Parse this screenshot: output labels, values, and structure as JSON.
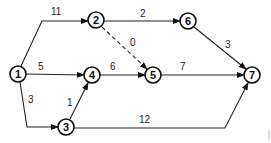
{
  "diagram": {
    "type": "activity-network",
    "nodes": [
      {
        "id": "1",
        "label": "1",
        "x": 18,
        "y": 74
      },
      {
        "id": "2",
        "label": "2",
        "x": 96,
        "y": 20
      },
      {
        "id": "3",
        "label": "3",
        "x": 66,
        "y": 127
      },
      {
        "id": "4",
        "label": "4",
        "x": 92,
        "y": 75
      },
      {
        "id": "5",
        "label": "5",
        "x": 153,
        "y": 75
      },
      {
        "id": "6",
        "label": "6",
        "x": 188,
        "y": 21
      },
      {
        "id": "7",
        "label": "7",
        "x": 252,
        "y": 75
      }
    ],
    "edges": [
      {
        "from": "1",
        "to": "2",
        "weight": "11",
        "style": "solid"
      },
      {
        "from": "1",
        "to": "4",
        "weight": "5",
        "style": "solid"
      },
      {
        "from": "1",
        "to": "3",
        "weight": "3",
        "style": "solid"
      },
      {
        "from": "3",
        "to": "4",
        "weight": "1",
        "style": "solid"
      },
      {
        "from": "2",
        "to": "6",
        "weight": "2",
        "style": "solid"
      },
      {
        "from": "2",
        "to": "5",
        "weight": "0",
        "style": "dashed"
      },
      {
        "from": "4",
        "to": "5",
        "weight": "6",
        "style": "solid"
      },
      {
        "from": "5",
        "to": "7",
        "weight": "7",
        "style": "solid"
      },
      {
        "from": "6",
        "to": "7",
        "weight": "3",
        "style": "solid"
      },
      {
        "from": "3",
        "to": "7",
        "weight": "12",
        "style": "solid"
      }
    ]
  },
  "labels": {
    "n1": "1",
    "n2": "2",
    "n3": "3",
    "n4": "4",
    "n5": "5",
    "n6": "6",
    "n7": "7",
    "e12": "11",
    "e14": "5",
    "e13": "3",
    "e34": "1",
    "e26": "2",
    "e25": "0",
    "e45": "6",
    "e57": "7",
    "e67": "3",
    "e37": "12"
  }
}
